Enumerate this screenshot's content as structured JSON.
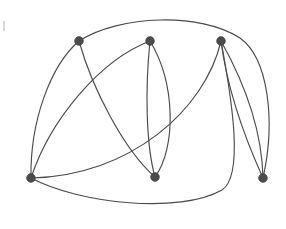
{
  "figure": {
    "kind": "graph-diagram",
    "title": "",
    "caption": "",
    "background_color": "#ffffff",
    "width": 286,
    "height": 229
  },
  "style": {
    "edge_color": "#4a4a4a",
    "edge_width": 1.15,
    "vertex_fill": "#4b4b4b",
    "vertex_stroke": "#3d3d3d",
    "vertex_radius": 4.4,
    "speck_color": "#d8d8d8"
  },
  "chart_data": {
    "type": "diagram",
    "subtype": "undirected-multigraph",
    "title": "",
    "xlabel": "",
    "ylabel": "",
    "grid": false,
    "legend": null,
    "vertex_count": 6,
    "edge_count": 9,
    "vertices": [
      {
        "id": "v1",
        "label": "",
        "x": 79,
        "y": 41,
        "degree": 3
      },
      {
        "id": "v2",
        "label": "",
        "x": 150,
        "y": 41,
        "degree": 3
      },
      {
        "id": "v3",
        "label": "",
        "x": 221,
        "y": 41,
        "degree": 4
      },
      {
        "id": "v4",
        "label": "",
        "x": 31,
        "y": 178,
        "degree": 3
      },
      {
        "id": "v5",
        "label": "",
        "x": 155,
        "y": 177,
        "degree": 3
      },
      {
        "id": "v6",
        "label": "",
        "x": 263,
        "y": 178,
        "degree": 3
      }
    ],
    "edges": [
      {
        "id": "e1",
        "source": "v1",
        "target": "v6",
        "multiplicity_index": 1,
        "note": "long outer arc over the top, down the right side",
        "path": "M 79 41 C 120 15, 200 12, 240 38 C 268 58, 276 120, 263 178"
      },
      {
        "id": "e2",
        "source": "v1",
        "target": "v4",
        "multiplicity_index": 1,
        "note": "bulges left",
        "path": "M 79 41 C 50 66, 30 122, 31 178"
      },
      {
        "id": "e3",
        "source": "v1",
        "target": "v5",
        "multiplicity_index": 1,
        "note": "descends right to bottom-middle",
        "path": "M 79 41 C 92 88, 124 150, 155 177"
      },
      {
        "id": "e4",
        "source": "v4",
        "target": "v2",
        "multiplicity_index": 1,
        "note": "arcs up-right from bottom-left",
        "path": "M 31 178 C 50 120, 100 60, 150 41"
      },
      {
        "id": "e5",
        "source": "v2",
        "target": "v5",
        "multiplicity_index": 1,
        "note": "left branch of bigon",
        "path": "M 150 41 C 145 90, 146 145, 155 177"
      },
      {
        "id": "e6",
        "source": "v2",
        "target": "v5",
        "multiplicity_index": 2,
        "note": "right branch of bigon",
        "path": "M 150 41 C 176 84, 176 148, 155 177"
      },
      {
        "id": "e7",
        "source": "v3",
        "target": "v4",
        "multiplicity_index": 1,
        "note": "sweeping arc to bottom-left",
        "path": "M 221 41 C 205 110, 130 176, 31 178"
      },
      {
        "id": "e8",
        "source": "v3",
        "target": "v6",
        "multiplicity_index": 1,
        "note": "inner of two parallel right edges",
        "path": "M 221 41 C 228 95, 248 145, 263 178"
      },
      {
        "id": "e9",
        "source": "v3",
        "target": "v6",
        "multiplicity_index": 2,
        "note": "outer of two parallel right edges",
        "path": "M 221 41 C 244 82, 262 130, 263 178"
      }
    ],
    "extra_strokes": [
      {
        "id": "x1",
        "note": "long bottom arc from bottom-left sagging down and sweeping up to top-right node",
        "source": "v4",
        "target": "v3",
        "path": "M 31 178 C 80 204, 180 214, 222 190 C 244 176, 232 100, 221 41"
      }
    ]
  },
  "marks": {
    "speck": {
      "x": 3,
      "y": 21,
      "width": 2,
      "height": 10
    }
  }
}
